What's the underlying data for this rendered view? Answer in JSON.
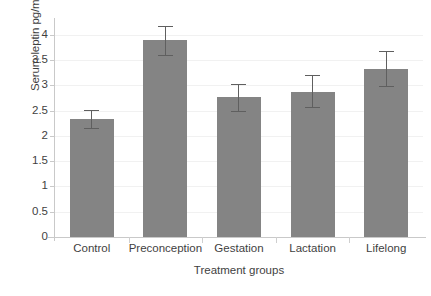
{
  "chart_data": {
    "type": "bar",
    "title": "",
    "xlabel": "Treatment groups",
    "ylabel": "Serum leptin pg/ml",
    "categories": [
      "Control",
      "Preconception",
      "Gestation",
      "Lactation",
      "Lifelong"
    ],
    "values": [
      2.33,
      3.89,
      2.76,
      2.87,
      3.33
    ],
    "errors_upper": [
      2.52,
      4.18,
      3.03,
      3.2,
      3.67
    ],
    "errors_lower": [
      2.15,
      3.6,
      2.5,
      2.57,
      2.98
    ],
    "error_type": "error-bar",
    "ylim": [
      0,
      4.25
    ],
    "ytick_labels": [
      "0",
      "0.5",
      "1",
      "1.5",
      "2",
      "2.5",
      "3",
      "3.5",
      "4"
    ],
    "ytick_values": [
      0,
      0.5,
      1,
      1.5,
      2,
      2.5,
      3,
      3.5,
      4
    ],
    "grid": true,
    "legend": "none",
    "bar_color": "#848484",
    "error_color": "#5f5f5f",
    "axis_color": "#c9c9c9",
    "grid_color": "#f1f1f1",
    "text_color": "#3f3f3f",
    "background": "#ffffff"
  }
}
